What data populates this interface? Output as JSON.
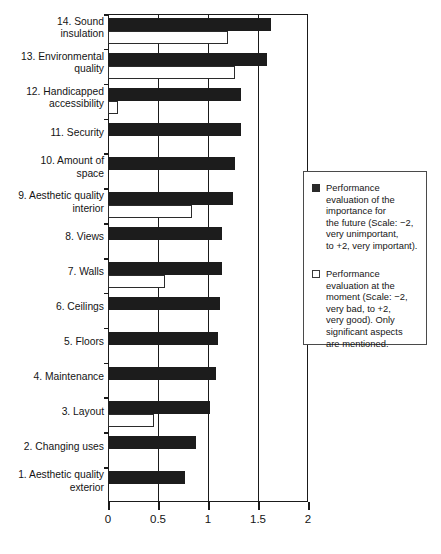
{
  "chart_data": {
    "type": "bar",
    "orientation": "horizontal",
    "title": "",
    "xlabel": "",
    "ylabel": "",
    "xlim": [
      0,
      2
    ],
    "xticks": [
      0,
      0.5,
      1,
      1.5,
      2
    ],
    "xtick_labels": [
      "0",
      "0.5",
      "1",
      "1.5",
      "2"
    ],
    "grid": true,
    "grid_axis": "x",
    "legend_position": "right",
    "categories": [
      "14. Sound insulation",
      "13. Environmental quality",
      "12. Handicapped accessibility",
      "11. Security",
      "10. Amount of space",
      "9. Aesthetic quality interior",
      "8. Views",
      "7. Walls",
      "6. Ceilings",
      "5. Floors",
      "4. Maintenance",
      "3. Layout",
      "2. Changing uses",
      "1. Aesthetic quality exterior"
    ],
    "category_lines": [
      [
        "14. Sound",
        "insulation"
      ],
      [
        "13. Environmental",
        "quality"
      ],
      [
        "12. Handicapped",
        "accessibility"
      ],
      [
        "11. Security"
      ],
      [
        "10. Amount of",
        "space"
      ],
      [
        "9. Aesthetic quality",
        "interior"
      ],
      [
        "8. Views"
      ],
      [
        "7. Walls"
      ],
      [
        "6. Ceilings"
      ],
      [
        "5. Floors"
      ],
      [
        "4. Maintenance"
      ],
      [
        "3. Layout"
      ],
      [
        "2. Changing uses"
      ],
      [
        "1. Aesthetic quality",
        "exterior"
      ]
    ],
    "series": [
      {
        "name": "importance-for-the-future",
        "label": "Performance evaluation of the importance for the future (Scale: −2, very unimportant, to +2, very important).",
        "color": "#1c1c1c",
        "style": "filled",
        "values": [
          1.63,
          1.59,
          1.33,
          1.33,
          1.27,
          1.25,
          1.14,
          1.14,
          1.12,
          1.1,
          1.08,
          1.02,
          0.88,
          0.77
        ]
      },
      {
        "name": "evaluation-at-the-moment",
        "label": "Performance evaluation at the moment (Scale: −2, very bad, to +2, very good). Only significant aspects are mentioned.",
        "color": "#ffffff",
        "style": "hollow",
        "values": [
          1.2,
          1.27,
          0.1,
          null,
          null,
          0.84,
          null,
          0.57,
          null,
          null,
          null,
          0.46,
          null,
          null
        ]
      }
    ]
  },
  "legend": {
    "entries": [
      {
        "swatch": "filled-square-icon",
        "lines": [
          "Performance",
          "evaluation of the",
          "importance for",
          "the future (Scale: −2,",
          "very unimportant,",
          "to +2, very important)."
        ]
      },
      {
        "swatch": "hollow-square-icon",
        "lines": [
          "Performance",
          "evaluation at the",
          "moment (Scale: −2,",
          "very bad, to +2,",
          "very good). Only",
          "significant aspects",
          "are mentioned."
        ]
      }
    ]
  },
  "colors": {
    "axis": "#1a1a1a",
    "filled_bar": "#1c1c1c",
    "hollow_bar_border": "#2b2b2b",
    "background": "#ffffff",
    "legend_border": "#4a4a4a"
  }
}
